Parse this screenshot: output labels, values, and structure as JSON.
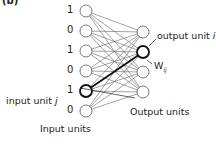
{
  "panel_label": "(b)",
  "input_layer": {
    "values": [
      "1",
      "0",
      "1",
      "0",
      "1",
      "0"
    ],
    "caption": "Input units",
    "highlight_label": "input unit ",
    "highlight_var": "j",
    "highlight_index": 4
  },
  "output_layer": {
    "count": 4,
    "caption": "Output units",
    "highlight_label": "output unit ",
    "highlight_var": "i",
    "highlight_index": 1
  },
  "weight_label": "W",
  "weight_subscript": "ij",
  "colors": {
    "node_stroke": "#444444",
    "edge": "#555555",
    "highlight": "#111111"
  }
}
